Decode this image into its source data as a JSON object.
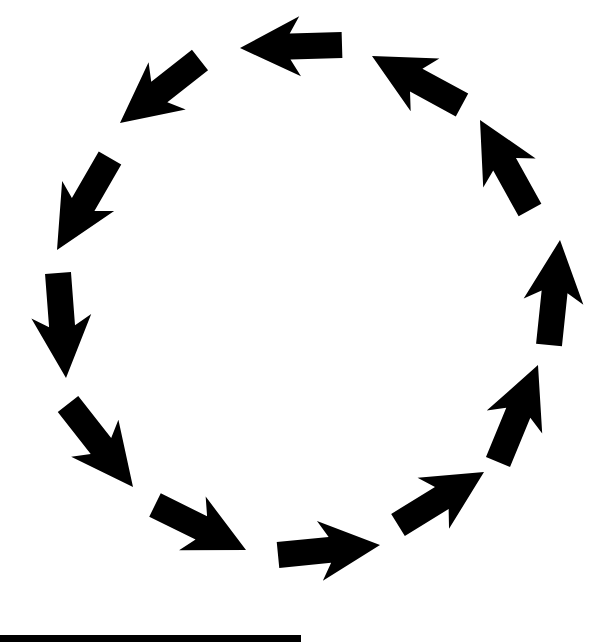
{
  "diagram": {
    "type": "cycle",
    "direction": "counterclockwise",
    "arrow_color": "#000000",
    "background": "#ffffff",
    "arrows": [
      {
        "id": 1,
        "tail": [
          342,
          45
        ],
        "head": [
          240,
          48
        ]
      },
      {
        "id": 2,
        "tail": [
          200,
          60
        ],
        "head": [
          120,
          123
        ]
      },
      {
        "id": 3,
        "tail": [
          110,
          158
        ],
        "head": [
          57,
          250
        ]
      },
      {
        "id": 4,
        "tail": [
          58,
          273
        ],
        "head": [
          66,
          378
        ]
      },
      {
        "id": 5,
        "tail": [
          68,
          404
        ],
        "head": [
          133,
          487
        ]
      },
      {
        "id": 6,
        "tail": [
          155,
          505
        ],
        "head": [
          246,
          550
        ]
      },
      {
        "id": 7,
        "tail": [
          278,
          555
        ],
        "head": [
          380,
          545
        ]
      },
      {
        "id": 8,
        "tail": [
          398,
          525
        ],
        "head": [
          484,
          472
        ]
      },
      {
        "id": 9,
        "tail": [
          498,
          462
        ],
        "head": [
          538,
          365
        ]
      },
      {
        "id": 10,
        "tail": [
          549,
          345
        ],
        "head": [
          560,
          240
        ]
      },
      {
        "id": 11,
        "tail": [
          530,
          210
        ],
        "head": [
          480,
          120
        ]
      },
      {
        "id": 12,
        "tail": [
          462,
          105
        ],
        "head": [
          372,
          56
        ]
      }
    ]
  },
  "footer_bar": {
    "color": "#000000",
    "width": 301
  }
}
